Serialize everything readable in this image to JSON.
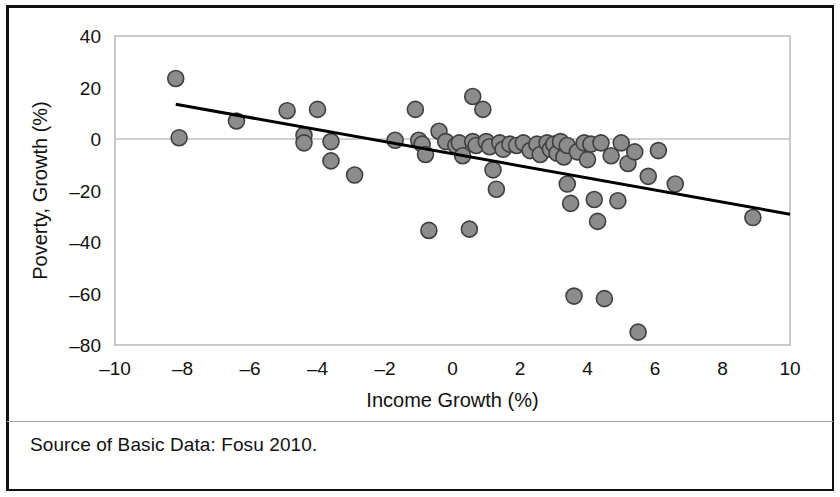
{
  "figure": {
    "source_note": "Source of Basic Data:  Fosu 2010."
  },
  "chart_data": {
    "type": "scatter",
    "title": "",
    "xlabel": "Income Growth (%)",
    "ylabel": "Poverty, Growth (%)",
    "xlim": [
      -10,
      10
    ],
    "ylim": [
      -80,
      40
    ],
    "xticks": [
      -10,
      -8,
      -6,
      -4,
      -2,
      0,
      2,
      4,
      6,
      8,
      10
    ],
    "xtick_labels": [
      "–10",
      "–8",
      "–6",
      "–4",
      "–2",
      "0",
      "2",
      "4",
      "6",
      "8",
      "10"
    ],
    "yticks": [
      40,
      20,
      0,
      -20,
      -40,
      -60,
      -80
    ],
    "ytick_labels": [
      "40",
      "20",
      "0",
      "–20",
      "–40",
      "–60",
      "–80"
    ],
    "grid": "horizontal-at-zero-and-top",
    "legend": "none",
    "marker": {
      "shape": "circle",
      "fill_color": "#8c8c8c",
      "edge_color": "#3f3f3f",
      "radius_px": 8
    },
    "trendline": {
      "visible": true,
      "color": "#000000",
      "width_px": 3,
      "x_start": -8.2,
      "y_start": 13.5,
      "x_end": 10.0,
      "y_end": -29.2
    },
    "points": [
      {
        "x": -8.2,
        "y": 23.5
      },
      {
        "x": -8.1,
        "y": 0.5
      },
      {
        "x": -6.4,
        "y": 7.0
      },
      {
        "x": -4.9,
        "y": 11.0
      },
      {
        "x": -4.4,
        "y": 1.5
      },
      {
        "x": -4.4,
        "y": -1.5
      },
      {
        "x": -4.0,
        "y": 11.5
      },
      {
        "x": -3.6,
        "y": -1.0
      },
      {
        "x": -3.6,
        "y": -8.5
      },
      {
        "x": -2.9,
        "y": -14.0
      },
      {
        "x": -1.7,
        "y": -0.5
      },
      {
        "x": -1.1,
        "y": 11.5
      },
      {
        "x": -1.0,
        "y": -0.5
      },
      {
        "x": -0.9,
        "y": -2.0
      },
      {
        "x": -0.8,
        "y": -6.0
      },
      {
        "x": -0.7,
        "y": -35.5
      },
      {
        "x": -0.4,
        "y": 3.0
      },
      {
        "x": -0.2,
        "y": -1.0
      },
      {
        "x": 0.1,
        "y": -2.5
      },
      {
        "x": 0.2,
        "y": -1.5
      },
      {
        "x": 0.3,
        "y": -6.5
      },
      {
        "x": 0.5,
        "y": -35.0
      },
      {
        "x": 0.6,
        "y": 16.5
      },
      {
        "x": 0.6,
        "y": -1.0
      },
      {
        "x": 0.7,
        "y": -2.5
      },
      {
        "x": 0.9,
        "y": 11.5
      },
      {
        "x": 1.0,
        "y": -1.0
      },
      {
        "x": 1.1,
        "y": -3.0
      },
      {
        "x": 1.2,
        "y": -12.0
      },
      {
        "x": 1.3,
        "y": -19.5
      },
      {
        "x": 1.4,
        "y": -1.5
      },
      {
        "x": 1.5,
        "y": -4.0
      },
      {
        "x": 1.7,
        "y": -2.0
      },
      {
        "x": 1.9,
        "y": -2.5
      },
      {
        "x": 2.1,
        "y": -1.5
      },
      {
        "x": 2.3,
        "y": -4.5
      },
      {
        "x": 2.5,
        "y": -2.0
      },
      {
        "x": 2.6,
        "y": -6.0
      },
      {
        "x": 2.8,
        "y": -1.5
      },
      {
        "x": 2.9,
        "y": -4.0
      },
      {
        "x": 3.0,
        "y": -2.0
      },
      {
        "x": 3.1,
        "y": -5.5
      },
      {
        "x": 3.2,
        "y": -1.0
      },
      {
        "x": 3.3,
        "y": -7.0
      },
      {
        "x": 3.4,
        "y": -2.5
      },
      {
        "x": 3.4,
        "y": -17.5
      },
      {
        "x": 3.5,
        "y": -25.0
      },
      {
        "x": 3.6,
        "y": -61.0
      },
      {
        "x": 3.7,
        "y": -5.0
      },
      {
        "x": 3.9,
        "y": -1.5
      },
      {
        "x": 4.0,
        "y": -8.0
      },
      {
        "x": 4.1,
        "y": -2.0
      },
      {
        "x": 4.2,
        "y": -23.5
      },
      {
        "x": 4.3,
        "y": -32.0
      },
      {
        "x": 4.4,
        "y": -1.5
      },
      {
        "x": 4.5,
        "y": -62.0
      },
      {
        "x": 4.7,
        "y": -6.5
      },
      {
        "x": 4.9,
        "y": -24.0
      },
      {
        "x": 5.0,
        "y": -1.5
      },
      {
        "x": 5.2,
        "y": -9.5
      },
      {
        "x": 5.4,
        "y": -5.0
      },
      {
        "x": 5.5,
        "y": -75.0
      },
      {
        "x": 5.8,
        "y": -14.5
      },
      {
        "x": 6.1,
        "y": -4.5
      },
      {
        "x": 6.6,
        "y": -17.5
      },
      {
        "x": 8.9,
        "y": -30.5
      }
    ]
  }
}
